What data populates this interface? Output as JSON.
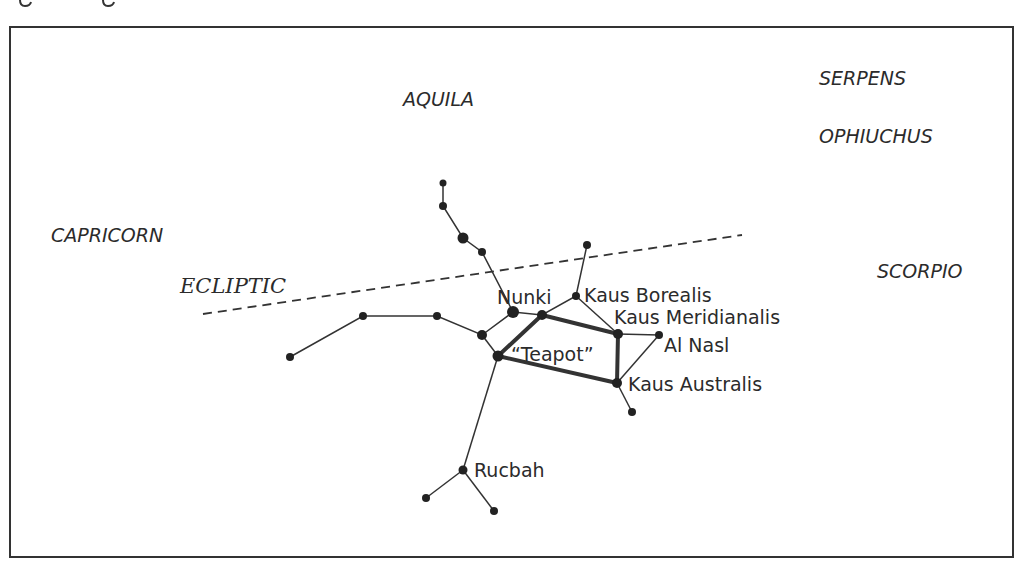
{
  "figure": {
    "title_fragment": "g            g",
    "constellations": [
      {
        "id": "aquila",
        "label": "AQUILA",
        "x": 403,
        "y": 106
      },
      {
        "id": "serpens",
        "label": "SERPENS",
        "x": 819,
        "y": 85
      },
      {
        "id": "ophiuchus",
        "label": "OPHIUCHUS",
        "x": 819,
        "y": 143
      },
      {
        "id": "capricorn",
        "label": "CAPRICORN",
        "x": 51,
        "y": 242
      },
      {
        "id": "scorpio",
        "label": "SCORPIO",
        "x": 877,
        "y": 278
      }
    ],
    "ecliptic": {
      "label": "ECLIPTIC",
      "x": 180,
      "y": 293
    },
    "stars": [
      {
        "name": "Nunki",
        "label": "Nunki",
        "label_x": 497,
        "label_y": 304
      },
      {
        "name": "Kaus Borealis",
        "label": "Kaus Borealis",
        "label_x": 584,
        "label_y": 302
      },
      {
        "name": "Kaus Meridianalis",
        "label": "Kaus Meridianalis",
        "label_x": 614,
        "label_y": 324
      },
      {
        "name": "Al Nasl",
        "label": "Al Nasl",
        "label_x": 664,
        "label_y": 352
      },
      {
        "name": "Kaus Australis",
        "label": "Kaus Australis",
        "label_x": 628,
        "label_y": 391
      },
      {
        "name": "Rucbah",
        "label": "Rucbah",
        "label_x": 474,
        "label_y": 477
      }
    ],
    "asterism": {
      "label": "“Teapot”",
      "x": 511,
      "y": 361
    }
  }
}
